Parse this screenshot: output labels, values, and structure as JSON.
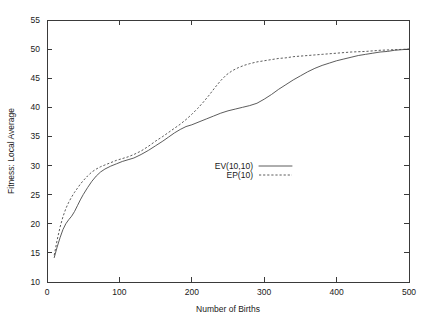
{
  "chart_data": {
    "type": "line",
    "title": "",
    "xlabel": "Number of Births",
    "ylabel": "Fitness: Local Average",
    "xlim": [
      0,
      500
    ],
    "ylim": [
      10,
      55
    ],
    "xticks": [
      "0",
      "100",
      "200",
      "300",
      "400",
      "500"
    ],
    "yticks": [
      "10",
      "15",
      "20",
      "25",
      "30",
      "35",
      "40",
      "45",
      "50",
      "55"
    ],
    "grid": false,
    "legend_position": "center",
    "series": [
      {
        "name": "EV(10,10)",
        "style": "solid",
        "x": [
          10,
          14,
          18,
          22,
          26,
          30,
          34,
          38,
          42,
          46,
          50,
          56,
          62,
          68,
          74,
          80,
          88,
          96,
          104,
          112,
          120,
          130,
          140,
          150,
          160,
          168,
          176,
          184,
          192,
          200,
          210,
          220,
          230,
          240,
          250,
          260,
          270,
          280,
          290,
          300,
          310,
          320,
          330,
          340,
          350,
          360,
          370,
          380,
          390,
          400,
          410,
          420,
          430,
          440,
          450,
          460,
          470,
          480,
          490,
          500
        ],
        "y": [
          14.2,
          16.0,
          17.6,
          19.0,
          20.0,
          20.7,
          21.3,
          22.1,
          23.1,
          24.1,
          25.0,
          26.2,
          27.3,
          28.2,
          28.9,
          29.4,
          29.9,
          30.3,
          30.7,
          31.0,
          31.3,
          31.9,
          32.6,
          33.4,
          34.2,
          34.9,
          35.6,
          36.2,
          36.7,
          37.0,
          37.5,
          38.0,
          38.5,
          39.0,
          39.4,
          39.7,
          40.0,
          40.3,
          40.7,
          41.4,
          42.2,
          43.1,
          43.9,
          44.7,
          45.4,
          46.1,
          46.7,
          47.2,
          47.6,
          48.0,
          48.3,
          48.6,
          48.9,
          49.1,
          49.3,
          49.5,
          49.6,
          49.8,
          49.9,
          50.0
        ]
      },
      {
        "name": "EP(10)",
        "style": "dashed",
        "x": [
          10,
          14,
          18,
          22,
          26,
          30,
          34,
          38,
          42,
          46,
          50,
          56,
          62,
          68,
          74,
          80,
          88,
          96,
          104,
          112,
          120,
          130,
          140,
          150,
          160,
          168,
          176,
          184,
          192,
          200,
          208,
          216,
          224,
          232,
          240,
          248,
          256,
          264,
          272,
          280,
          290,
          300,
          310,
          320,
          330,
          340,
          350,
          360,
          370,
          380,
          390,
          400,
          420,
          440,
          460,
          480,
          500
        ],
        "y": [
          14.6,
          17.2,
          19.4,
          21.2,
          22.6,
          23.7,
          24.6,
          25.4,
          26.1,
          26.8,
          27.4,
          28.2,
          28.9,
          29.4,
          29.8,
          30.1,
          30.5,
          30.9,
          31.2,
          31.5,
          31.9,
          32.5,
          33.3,
          34.2,
          35.0,
          35.7,
          36.4,
          37.1,
          37.9,
          38.8,
          39.8,
          40.9,
          42.1,
          43.4,
          44.6,
          45.6,
          46.3,
          46.8,
          47.2,
          47.5,
          47.8,
          48.0,
          48.2,
          48.4,
          48.5,
          48.7,
          48.8,
          48.9,
          49.0,
          49.1,
          49.2,
          49.3,
          49.5,
          49.6,
          49.8,
          49.9,
          50.0
        ]
      }
    ]
  },
  "legend": {
    "entries": [
      {
        "label": "EV(10,10)",
        "style": "solid"
      },
      {
        "label": "EP(10)",
        "style": "dashed"
      }
    ]
  }
}
